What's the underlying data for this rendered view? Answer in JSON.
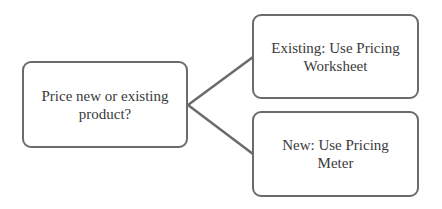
{
  "diagram": {
    "type": "decision-tree",
    "nodes": [
      {
        "id": "root",
        "label": "Price new or existing product?"
      },
      {
        "id": "existing",
        "label": "Existing: Use Pricing Worksheet"
      },
      {
        "id": "new",
        "label": "New: Use Pricing Meter"
      }
    ],
    "edges": [
      {
        "from": "root",
        "to": "existing"
      },
      {
        "from": "root",
        "to": "new"
      }
    ],
    "colors": {
      "stroke": "#6b6b6b",
      "text": "#3a3a3a",
      "background": "#ffffff"
    }
  }
}
